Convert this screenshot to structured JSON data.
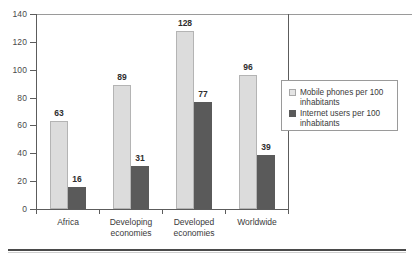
{
  "chart_data": {
    "type": "bar",
    "title": "",
    "xlabel": "",
    "ylabel": "",
    "ylim": [
      0,
      140
    ],
    "yticks": [
      0,
      20,
      40,
      60,
      80,
      100,
      120,
      140
    ],
    "ytick_labels": [
      "0",
      "20",
      "40",
      "60",
      "80",
      "100",
      "120",
      "140"
    ],
    "grid": false,
    "legend_position": "right",
    "categories": [
      "Africa",
      "Developing economies",
      "Developed economies",
      "Worldwide"
    ],
    "category_lines": [
      [
        "Africa"
      ],
      [
        "Developing",
        "economies"
      ],
      [
        "Developed",
        "economies"
      ],
      [
        "Worldwide"
      ]
    ],
    "series": [
      {
        "name": "Mobile phones per 100 inhabitants",
        "color": "#dcdcdc",
        "values": [
          63,
          89,
          128,
          96
        ],
        "labels": [
          "63",
          "89",
          "128",
          "96"
        ]
      },
      {
        "name": "Internet users per 100 inhabitants",
        "color": "#5a5a5a",
        "values": [
          16,
          31,
          77,
          39
        ],
        "labels": [
          "16",
          "31",
          "77",
          "39"
        ]
      }
    ]
  },
  "legend": {
    "items": [
      {
        "swatch": "light",
        "line1": "Mobile phones per 100",
        "line2": "inhabitants"
      },
      {
        "swatch": "dark",
        "line1": "Internet users per 100",
        "line2": "inhabitants"
      }
    ]
  },
  "colors": {
    "series_light": "#dcdcdc",
    "series_dark": "#5a5a5a",
    "axis": "#5c5c5c",
    "text": "#3a3a3a",
    "legend_border": "#9a9a9a"
  }
}
